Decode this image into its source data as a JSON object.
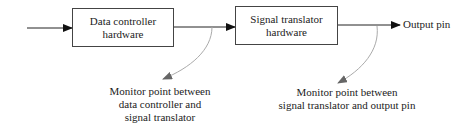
{
  "diagram": {
    "blocks": [
      {
        "id": "data-controller",
        "lines": [
          "Data controller",
          "hardware"
        ]
      },
      {
        "id": "signal-translator",
        "lines": [
          "Signal translator",
          "hardware"
        ]
      }
    ],
    "output_label": "Output pin",
    "monitor_points": [
      {
        "lines": [
          "Monitor point between",
          "data controller and",
          "signal translator"
        ]
      },
      {
        "lines": [
          "Monitor point between",
          "signal translator and output pin"
        ]
      }
    ],
    "colors": {
      "line": "#222222",
      "monitor_arrow": "#9a9a9a",
      "monitor_arrowhead": "#666666",
      "box_border": "#444444"
    }
  }
}
